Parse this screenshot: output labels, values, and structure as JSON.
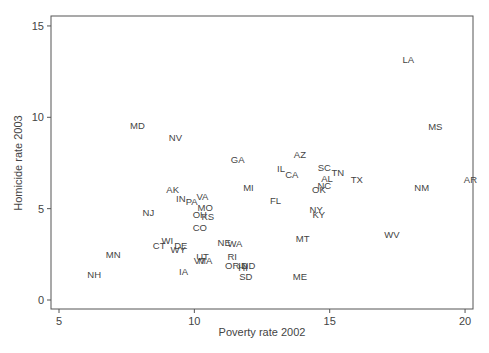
{
  "chart_data": {
    "type": "scatter",
    "title": "",
    "xlabel": "Poverty rate 2002",
    "ylabel": "Homicide rate 2003",
    "xlim": [
      5,
      20.3
    ],
    "ylim": [
      -0.2,
      15
    ],
    "xticks": [
      5,
      10,
      15,
      20
    ],
    "yticks": [
      0,
      5,
      10,
      15
    ],
    "grid": false,
    "legend": null,
    "marker": "state-label",
    "points": [
      {
        "label": "LA",
        "x": 17.9,
        "y": 13.2
      },
      {
        "label": "MD",
        "x": 7.9,
        "y": 9.6
      },
      {
        "label": "NV",
        "x": 9.3,
        "y": 8.9
      },
      {
        "label": "MS",
        "x": 18.9,
        "y": 9.5
      },
      {
        "label": "GA",
        "x": 11.6,
        "y": 7.7
      },
      {
        "label": "AZ",
        "x": 13.9,
        "y": 8.0
      },
      {
        "label": "IL",
        "x": 13.2,
        "y": 7.2
      },
      {
        "label": "CA",
        "x": 13.6,
        "y": 6.9
      },
      {
        "label": "SC",
        "x": 14.8,
        "y": 7.3
      },
      {
        "label": "TN",
        "x": 15.3,
        "y": 7.0
      },
      {
        "label": "AL",
        "x": 14.9,
        "y": 6.7
      },
      {
        "label": "NC",
        "x": 14.8,
        "y": 6.3
      },
      {
        "label": "OK",
        "x": 14.6,
        "y": 6.1
      },
      {
        "label": "TX",
        "x": 16.0,
        "y": 6.6
      },
      {
        "label": "NM",
        "x": 18.4,
        "y": 6.2
      },
      {
        "label": "AR",
        "x": 20.2,
        "y": 6.6
      },
      {
        "label": "MI",
        "x": 12.0,
        "y": 6.2
      },
      {
        "label": "FL",
        "x": 13.0,
        "y": 5.5
      },
      {
        "label": "NY",
        "x": 14.5,
        "y": 5.0
      },
      {
        "label": "KY",
        "x": 14.6,
        "y": 4.7
      },
      {
        "label": "AK",
        "x": 9.2,
        "y": 6.1
      },
      {
        "label": "IN",
        "x": 9.5,
        "y": 5.6
      },
      {
        "label": "PA",
        "x": 9.9,
        "y": 5.4
      },
      {
        "label": "VA",
        "x": 10.3,
        "y": 5.7
      },
      {
        "label": "MO",
        "x": 10.4,
        "y": 5.1
      },
      {
        "label": "OH",
        "x": 10.2,
        "y": 4.7
      },
      {
        "label": "KS",
        "x": 10.5,
        "y": 4.6
      },
      {
        "label": "NJ",
        "x": 8.3,
        "y": 4.8
      },
      {
        "label": "CO",
        "x": 10.2,
        "y": 4.0
      },
      {
        "label": "WI",
        "x": 9.0,
        "y": 3.3
      },
      {
        "label": "CT",
        "x": 8.7,
        "y": 3.0
      },
      {
        "label": "DE",
        "x": 9.5,
        "y": 3.0
      },
      {
        "label": "WY",
        "x": 9.4,
        "y": 2.8
      },
      {
        "label": "NE",
        "x": 11.1,
        "y": 3.2
      },
      {
        "label": "WA",
        "x": 11.5,
        "y": 3.1
      },
      {
        "label": "MT",
        "x": 14.0,
        "y": 3.4
      },
      {
        "label": "WV",
        "x": 17.3,
        "y": 3.6
      },
      {
        "label": "MN",
        "x": 7.0,
        "y": 2.5
      },
      {
        "label": "UT",
        "x": 10.3,
        "y": 2.4
      },
      {
        "label": "VT",
        "x": 10.2,
        "y": 2.2
      },
      {
        "label": "MA",
        "x": 10.4,
        "y": 2.2
      },
      {
        "label": "RI",
        "x": 11.4,
        "y": 2.4
      },
      {
        "label": "OR",
        "x": 11.4,
        "y": 1.9
      },
      {
        "label": "ID",
        "x": 11.8,
        "y": 1.9
      },
      {
        "label": "HI",
        "x": 11.8,
        "y": 1.8
      },
      {
        "label": "ND",
        "x": 12.0,
        "y": 1.9
      },
      {
        "label": "SD",
        "x": 11.9,
        "y": 1.3
      },
      {
        "label": "IA",
        "x": 9.6,
        "y": 1.6
      },
      {
        "label": "NH",
        "x": 6.3,
        "y": 1.4
      },
      {
        "label": "ME",
        "x": 13.9,
        "y": 1.3
      }
    ]
  },
  "style": {
    "axis_color": "#555555",
    "label_color": "#444444",
    "text_color": "#333333"
  }
}
